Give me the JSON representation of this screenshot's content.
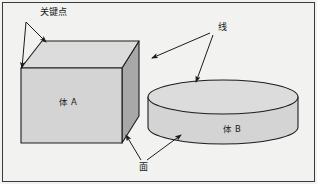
{
  "figure": {
    "background_color": "#f2f2f0",
    "frame_color": "#3a3a3a",
    "line_color": "#1c1c1c"
  },
  "annotations": {
    "keypoint": {
      "label": "关键点",
      "meaning": "key point",
      "x": 40,
      "y": 15,
      "leaders": [
        {
          "from_x": 26,
          "from_y": 22,
          "to_x": 46,
          "to_y": 42
        },
        {
          "from_x": 26,
          "from_y": 22,
          "to_x": 22,
          "to_y": 68
        }
      ]
    },
    "line": {
      "label": "线",
      "meaning": "line / edge",
      "x": 218,
      "y": 30,
      "leaders": [
        {
          "from_x": 210,
          "from_y": 33,
          "to_x": 152,
          "to_y": 58
        },
        {
          "from_x": 213,
          "from_y": 35,
          "to_x": 196,
          "to_y": 82
        }
      ]
    },
    "face": {
      "label": "面",
      "meaning": "face / surface",
      "x": 143,
      "y": 170,
      "leaders": [
        {
          "from_x": 141,
          "from_y": 160,
          "to_x": 126,
          "to_y": 135
        },
        {
          "from_x": 147,
          "from_y": 160,
          "to_x": 181,
          "to_y": 135
        }
      ]
    }
  },
  "shapes": {
    "cube": {
      "name": "体 A",
      "meaning": "volume A",
      "label_x": 68,
      "label_y": 105,
      "front_fill": "#d4d4d4",
      "top_fill": "#dcdcdc",
      "side_fill": "#a8a8a8",
      "front_points": "21,68 122,68 122,143 21,143",
      "top_points": "21,68 42,41 139,41 122,68",
      "side_points": "122,68 139,41 139,116 122,143"
    },
    "cylinder": {
      "name": "体 B",
      "meaning": "volume B",
      "label_x": 232,
      "label_y": 132,
      "body_fill": "#d4d4d4",
      "top_fill": "#dcdcdc",
      "center_x": 223,
      "center_y": 97,
      "radius_x": 75,
      "radius_y": 17,
      "height": 30,
      "body_path": "M 148,97 L 148,127 A 75 17 0 0 0 298,127 L 298,97 Z"
    }
  }
}
